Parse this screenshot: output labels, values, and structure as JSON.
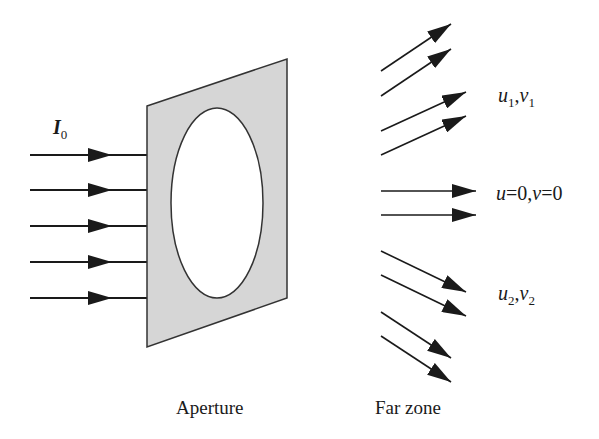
{
  "figure": {
    "incident_label": {
      "symbol": "I",
      "subscript": "0"
    },
    "aperture_label": "Aperture",
    "far_zone_label": "Far zone",
    "direction_labels": [
      {
        "u": "u",
        "u_sub": "1",
        "sep": ",",
        "v": "v",
        "v_sub": "1"
      },
      {
        "text_u": "u",
        "eq1": "=0,",
        "text_v": "v",
        "eq2": "=0"
      },
      {
        "u": "u",
        "u_sub": "2",
        "sep": ",",
        "v": "v",
        "v_sub": "2"
      }
    ],
    "colors": {
      "ink": "#1a1a1a",
      "aperture_fill": "#d6d6d6",
      "hole_fill": "#ffffff"
    },
    "incident_rays_y": [
      155,
      190,
      226,
      262,
      298
    ],
    "aperture_polygon": [
      [
        147,
        106
      ],
      [
        287,
        59
      ],
      [
        287,
        298
      ],
      [
        147,
        347
      ]
    ],
    "hole": {
      "cx": 217,
      "cy": 203,
      "rx": 46,
      "ry": 95
    },
    "far_zone_rays": [
      {
        "x1": 381,
        "y1": 71,
        "x2": 451,
        "y2": 24
      },
      {
        "x1": 381,
        "y1": 96,
        "x2": 451,
        "y2": 49
      },
      {
        "x1": 381,
        "y1": 131,
        "x2": 466,
        "y2": 92
      },
      {
        "x1": 381,
        "y1": 155,
        "x2": 466,
        "y2": 116
      },
      {
        "x1": 381,
        "y1": 191,
        "x2": 476,
        "y2": 191
      },
      {
        "x1": 381,
        "y1": 215,
        "x2": 476,
        "y2": 215
      },
      {
        "x1": 381,
        "y1": 251,
        "x2": 466,
        "y2": 292
      },
      {
        "x1": 381,
        "y1": 275,
        "x2": 466,
        "y2": 316
      },
      {
        "x1": 381,
        "y1": 312,
        "x2": 451,
        "y2": 358
      },
      {
        "x1": 381,
        "y1": 336,
        "x2": 451,
        "y2": 382
      }
    ]
  }
}
